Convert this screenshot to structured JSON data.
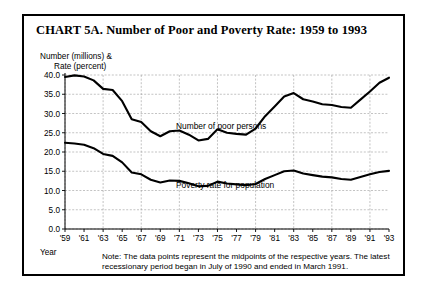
{
  "figure": {
    "title": "CHART 5A. Number of Poor and Poverty Rate: 1959 to 1993",
    "axis_caption_line1": "Number (millions) &",
    "axis_caption_line2": "Rate (percent)",
    "year_axis_word": "Year",
    "note": "Note: The data points represent the midpoints of the respective years. The latest recessionary period began in July of 1990 and ended in March 1991.",
    "line_color": "#000000",
    "grid_color": "#9a9a9a",
    "background": "#ffffff"
  },
  "chart_data": {
    "type": "line",
    "title": "CHART 5A. Number of Poor and Poverty Rate: 1959 to 1993",
    "xlabel": "Year",
    "ylabel": "Number (millions) & Rate (percent)",
    "ylim": [
      0.0,
      40.0
    ],
    "ytick_labels": [
      "0.0",
      "5.0",
      "10.0",
      "15.0",
      "20.0",
      "25.0",
      "30.0",
      "35.0",
      "40.0"
    ],
    "yticks": [
      0.0,
      5.0,
      10.0,
      15.0,
      20.0,
      25.0,
      30.0,
      35.0,
      40.0
    ],
    "xlim": [
      1959,
      1993
    ],
    "xtick_labels": [
      "'59",
      "'61",
      "'63",
      "'65",
      "'67",
      "'69",
      "'71",
      "'73",
      "'75",
      "'77",
      "'79",
      "'81",
      "'83",
      "'85",
      "'87",
      "'89",
      "'91",
      "'93"
    ],
    "xticks": [
      1959,
      1961,
      1963,
      1965,
      1967,
      1969,
      1971,
      1973,
      1975,
      1977,
      1979,
      1981,
      1983,
      1985,
      1987,
      1989,
      1991,
      1993
    ],
    "grid": true,
    "legend": "inline-annotations",
    "x": [
      1959,
      1960,
      1961,
      1962,
      1963,
      1964,
      1965,
      1966,
      1967,
      1968,
      1969,
      1970,
      1971,
      1972,
      1973,
      1974,
      1975,
      1976,
      1977,
      1978,
      1979,
      1980,
      1981,
      1982,
      1983,
      1984,
      1985,
      1986,
      1987,
      1988,
      1989,
      1990,
      1991,
      1992,
      1993
    ],
    "series": [
      {
        "name": "Number of poor persons",
        "annotation": "Number of poor persons",
        "units": "millions",
        "values": [
          39.5,
          39.9,
          39.6,
          38.6,
          36.4,
          36.1,
          33.2,
          28.5,
          27.8,
          25.4,
          24.1,
          25.4,
          25.6,
          24.5,
          23.0,
          23.4,
          25.9,
          25.0,
          24.7,
          24.5,
          26.1,
          29.3,
          31.8,
          34.4,
          35.3,
          33.7,
          33.1,
          32.4,
          32.2,
          31.7,
          31.5,
          33.6,
          35.7,
          38.0,
          39.3
        ]
      },
      {
        "name": "Poverty rate for population",
        "annotation": "Poverty rate for population",
        "units": "percent",
        "values": [
          22.4,
          22.2,
          21.9,
          21.0,
          19.5,
          19.0,
          17.3,
          14.7,
          14.2,
          12.8,
          12.1,
          12.6,
          12.5,
          11.9,
          11.1,
          11.2,
          12.3,
          11.8,
          11.6,
          11.4,
          11.7,
          13.0,
          14.0,
          15.0,
          15.2,
          14.4,
          14.0,
          13.6,
          13.4,
          13.0,
          12.8,
          13.5,
          14.2,
          14.8,
          15.1
        ]
      }
    ]
  }
}
